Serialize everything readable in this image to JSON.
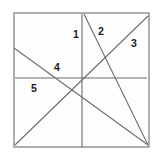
{
  "figure": {
    "background_color": "#ffffff",
    "panel_color": "#fdfdfd",
    "border_color": "#9a9a9a",
    "line_color": "#6d6d6d",
    "label_color": "#1a1a1a",
    "frame": {
      "x": 14,
      "y": 13,
      "width": 135,
      "height": 134
    }
  },
  "chart_data": {
    "type": "line",
    "xlabel": "",
    "ylabel": "",
    "grid": false,
    "legend": "none",
    "xlim": [
      0,
      163
    ],
    "ylim": [
      161,
      0
    ],
    "series": [
      {
        "name": "1",
        "label": "1",
        "description": "vertical line",
        "x": [
          82,
          82
        ],
        "y": [
          14,
          147
        ]
      },
      {
        "name": "2",
        "label": "2",
        "description": "steep diagonal from top-center to bottom-right",
        "x": [
          84,
          148
        ],
        "y": [
          14,
          145
        ]
      },
      {
        "name": "3",
        "label": "3",
        "description": "rising diagonal from bottom-left to top-right",
        "x": [
          15,
          148
        ],
        "y": [
          145,
          16
        ]
      },
      {
        "name": "4",
        "label": "4",
        "description": "falling diagonal from mid-left to bottom-right",
        "x": [
          14,
          148
        ],
        "y": [
          48,
          145
        ]
      },
      {
        "name": "5",
        "label": "5",
        "description": "horizontal line",
        "x": [
          15,
          147
        ],
        "y": [
          78,
          78
        ]
      }
    ],
    "labels": [
      {
        "text": "1",
        "x": 76,
        "y": 35
      },
      {
        "text": "2",
        "x": 101,
        "y": 32
      },
      {
        "text": "3",
        "x": 134,
        "y": 44
      },
      {
        "text": "4",
        "x": 57,
        "y": 68
      },
      {
        "text": "5",
        "x": 34,
        "y": 89
      }
    ]
  }
}
